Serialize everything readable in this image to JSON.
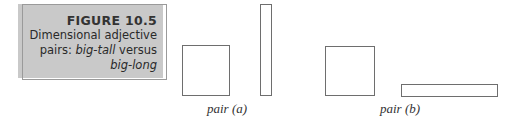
{
  "caption": {
    "figure_label": "FIGURE 10.5",
    "line1": "Dimensional adjective",
    "line2_prefix": "pairs: ",
    "line2_italic": "big-tall",
    "line2_suffix": " versus",
    "line3_italic": "big-long"
  },
  "pairs": [
    {
      "label": "pair (a)",
      "shapes": [
        {
          "name": "square",
          "x": 182,
          "y": 45,
          "w": 48,
          "h": 51
        },
        {
          "name": "tall-rectangle",
          "x": 260,
          "y": 4,
          "w": 12,
          "h": 92
        }
      ]
    },
    {
      "label": "pair (b)",
      "shapes": [
        {
          "name": "square",
          "x": 325,
          "y": 46,
          "w": 50,
          "h": 50
        },
        {
          "name": "long-rectangle",
          "x": 401,
          "y": 84,
          "w": 97,
          "h": 13
        }
      ]
    }
  ],
  "colors": {
    "caption_bg": "#c9c9c9",
    "shape_stroke": "#6e6e6e"
  }
}
